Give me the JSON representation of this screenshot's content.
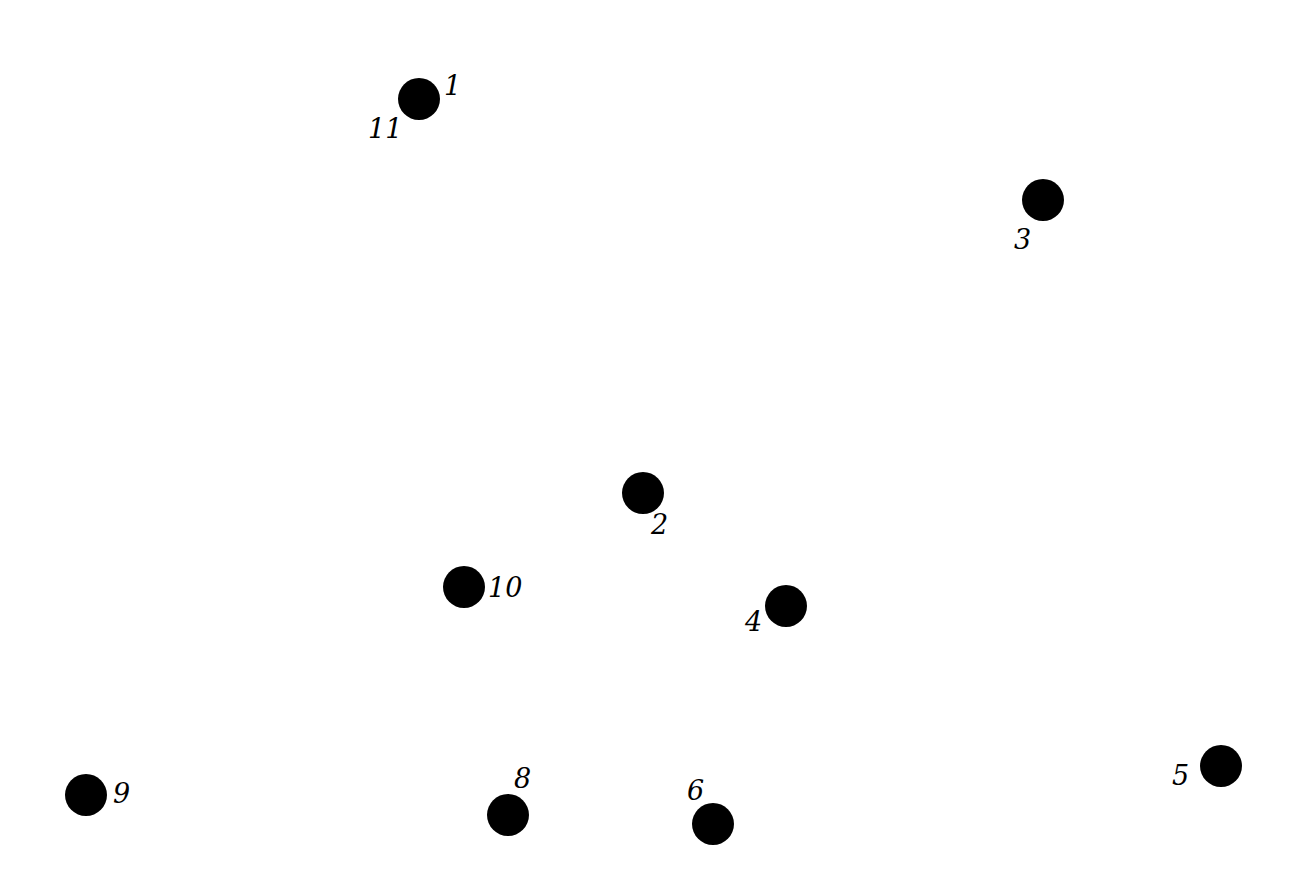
{
  "diagram": {
    "type": "connect-the-dots",
    "background": "#ffffff",
    "dot_color": "#000000",
    "dot_radius": 21,
    "dots": [
      {
        "id": "1",
        "cx": 419,
        "cy": 99,
        "labels": [
          {
            "text": "1",
            "x": 444,
            "y": 72
          },
          {
            "text": "11",
            "x": 368,
            "y": 115
          }
        ]
      },
      {
        "id": "2",
        "cx": 643,
        "cy": 493,
        "labels": [
          {
            "text": "2",
            "x": 651,
            "y": 511
          }
        ]
      },
      {
        "id": "3",
        "cx": 1043,
        "cy": 200,
        "labels": [
          {
            "text": "3",
            "x": 1014,
            "y": 226
          }
        ]
      },
      {
        "id": "4",
        "cx": 786,
        "cy": 606,
        "labels": [
          {
            "text": "4",
            "x": 745,
            "y": 608
          }
        ]
      },
      {
        "id": "5",
        "cx": 1221,
        "cy": 766,
        "labels": [
          {
            "text": "5",
            "x": 1172,
            "y": 762
          }
        ]
      },
      {
        "id": "6",
        "cx": 713,
        "cy": 824,
        "labels": [
          {
            "text": "6",
            "x": 687,
            "y": 777
          }
        ]
      },
      {
        "id": "8",
        "cx": 508,
        "cy": 815,
        "labels": [
          {
            "text": "8",
            "x": 514,
            "y": 765
          }
        ]
      },
      {
        "id": "9",
        "cx": 86,
        "cy": 795,
        "labels": [
          {
            "text": "9",
            "x": 113,
            "y": 780
          }
        ]
      },
      {
        "id": "10",
        "cx": 464,
        "cy": 587,
        "labels": [
          {
            "text": "10",
            "x": 488,
            "y": 574
          }
        ]
      }
    ]
  }
}
